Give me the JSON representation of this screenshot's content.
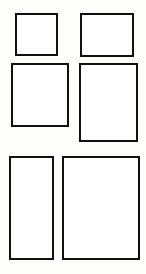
{
  "sheet": {
    "title": "Brick Paving Panel Layouts",
    "background_color": "#fdfdfb",
    "line_color": "#111111",
    "fill_color": "#ffffff",
    "figure_count": 6,
    "units": "px"
  },
  "figures": [
    {
      "id": "figure-1",
      "name": "panel-1x1",
      "label": "1 x 1 field",
      "field_cols": 1,
      "field_rows": 4,
      "x": 15,
      "y": 13,
      "width": 43,
      "height": 43,
      "border_width": 9,
      "field_grid_cols": 1,
      "field_grid_rows": 1,
      "top_border_segments": 3,
      "bottom_border_segments": 3,
      "left_border_segments": 3,
      "right_border_segments": 3
    },
    {
      "id": "figure-2",
      "name": "panel-2x1",
      "label": "2 x 1 field",
      "x": 80,
      "y": 13,
      "width": 54,
      "height": 44,
      "border_width": 9,
      "field_grid_cols": 2,
      "field_grid_rows": 1,
      "top_border_segments": 3,
      "bottom_border_segments": 3,
      "left_border_segments": 3,
      "right_border_segments": 3
    },
    {
      "id": "figure-3",
      "name": "panel-2x2",
      "label": "2 x 2 field",
      "x": 11,
      "y": 63,
      "width": 58,
      "height": 64,
      "border_width": 10,
      "field_grid_cols": 2,
      "field_grid_rows": 2,
      "top_border_segments": 3,
      "bottom_border_segments": 3,
      "left_border_segments": 3,
      "right_border_segments": 3
    },
    {
      "id": "figure-4",
      "name": "panel-2x3",
      "label": "2 x 3 field",
      "x": 79,
      "y": 63,
      "width": 59,
      "height": 79,
      "border_width": 10,
      "field_grid_cols": 2,
      "field_grid_rows": 3,
      "top_border_segments": 3,
      "bottom_border_segments": 3,
      "left_border_segments": 4,
      "right_border_segments": 4
    },
    {
      "id": "figure-5",
      "name": "panel-1x4",
      "label": "1 x 4 field",
      "x": 9,
      "y": 156,
      "width": 45,
      "height": 104,
      "border_width": 10,
      "field_grid_cols": 1,
      "field_grid_rows": 4,
      "top_border_segments": 3,
      "bottom_border_segments": 3,
      "left_border_segments": 5,
      "right_border_segments": 5
    },
    {
      "id": "figure-6",
      "name": "panel-3x4",
      "label": "3 x 4 field",
      "x": 62,
      "y": 156,
      "width": 78,
      "height": 104,
      "border_width": 10,
      "field_grid_cols": 3,
      "field_grid_rows": 4,
      "top_border_segments": 5,
      "bottom_border_segments": 5,
      "left_border_segments": 5,
      "right_border_segments": 5
    }
  ]
}
